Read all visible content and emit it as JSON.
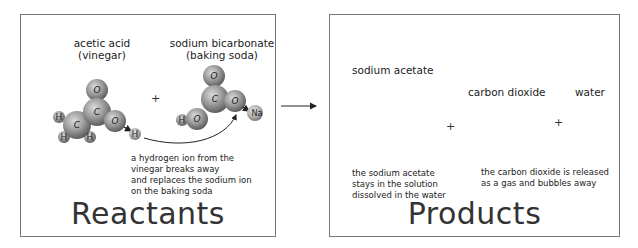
{
  "reactants": {
    "title": "Reactants",
    "acetic_acid": {
      "line1": "acetic acid",
      "line2": "(vinegar)"
    },
    "plus": "+",
    "sodium_bicarbonate": {
      "line1": "sodium bicarbonate",
      "line2": "(baking soda)"
    },
    "note": [
      "a hydrogen ion from the",
      "vinegar breaks away",
      "and replaces the sodium ion",
      "on the baking soda"
    ]
  },
  "products": {
    "title": "Products",
    "sodium_acetate": {
      "label": "sodium acetate"
    },
    "plus1": "+",
    "carbon_dioxide": {
      "label": "carbon dioxide"
    },
    "plus2": "+",
    "water": {
      "label": "water"
    },
    "note_left": [
      "the sodium acetate",
      "stays in the solution",
      "dissolved in the water"
    ],
    "note_right": [
      "the carbon dioxide is released",
      "as a gas and bubbles away"
    ]
  },
  "atoms": {
    "O": "O",
    "C": "C",
    "H": "H",
    "Na": "Na"
  },
  "colors": {
    "panel_border": "#777777",
    "atom_fill": "#8a8a8a",
    "atom_highlight": "#d8d8d8",
    "text": "#222222"
  }
}
